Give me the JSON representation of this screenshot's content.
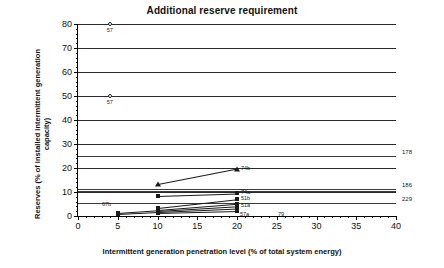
{
  "chart_data": {
    "type": "scatter",
    "title": "Additional reserve requirement",
    "xlabel": "Intermittent generation penetration level (% of total system energy)",
    "ylabel": "Reserves (% of installed intermittent generation capacity)",
    "xlim": [
      0,
      40
    ],
    "ylim": [
      0,
      80
    ],
    "xticks": [
      "0",
      "5",
      "10",
      "15",
      "20",
      "25",
      "30",
      "35",
      "40"
    ],
    "yticks": [
      "0",
      "10",
      "20",
      "30",
      "40",
      "50",
      "60",
      "70",
      "80"
    ],
    "grid": "horizontal",
    "legend": "none",
    "series": [
      {
        "name": "57-high",
        "label": "57",
        "marker": "circle",
        "line": false,
        "points": [
          {
            "x": 4,
            "y": 80
          }
        ]
      },
      {
        "name": "57-mid",
        "label": "57",
        "marker": "circle",
        "line": false,
        "points": [
          {
            "x": 4,
            "y": 50
          }
        ]
      },
      {
        "name": "74b",
        "label": "74b",
        "marker": "triangle",
        "line": true,
        "points": [
          {
            "x": 10,
            "y": 13.2
          },
          {
            "x": 20,
            "y": 19.7
          }
        ]
      },
      {
        "name": "74a",
        "label": "74a",
        "marker": "square",
        "line": true,
        "points": [
          {
            "x": 10,
            "y": 8.4
          },
          {
            "x": 20,
            "y": 9.4
          }
        ]
      },
      {
        "name": "51b",
        "label": "51b",
        "marker": "square",
        "line": true,
        "points": [
          {
            "x": 10,
            "y": 3.4
          },
          {
            "x": 20,
            "y": 7.0
          }
        ]
      },
      {
        "name": "79",
        "label": "79",
        "marker": "square",
        "line": true,
        "points": [
          {
            "x": 10,
            "y": 2.6
          },
          {
            "x": 20,
            "y": 5.2
          }
        ]
      },
      {
        "name": "51a",
        "label": "51a",
        "marker": "square",
        "line": true,
        "points": [
          {
            "x": 5,
            "y": 1.1
          },
          {
            "x": 10,
            "y": 2.2
          },
          {
            "x": 20,
            "y": 4.2
          }
        ]
      },
      {
        "name": "67b",
        "label": "67b",
        "marker": "square",
        "line": true,
        "points": [
          {
            "x": 5,
            "y": 1.0
          },
          {
            "x": 10,
            "y": 1.8
          },
          {
            "x": 20,
            "y": 3.2
          }
        ]
      },
      {
        "name": "57a",
        "label": "57a",
        "marker": "square",
        "line": true,
        "points": [
          {
            "x": 10,
            "y": 1.4
          },
          {
            "x": 20,
            "y": 2.2
          }
        ]
      }
    ],
    "edge_labels": [
      {
        "text": "178",
        "y": 25.0
      },
      {
        "text": "186",
        "y": 11.4
      },
      {
        "text": "229",
        "y": 5.6
      }
    ],
    "extra_gridlines": [
      25.0,
      11.4,
      10.6,
      5.6
    ]
  }
}
